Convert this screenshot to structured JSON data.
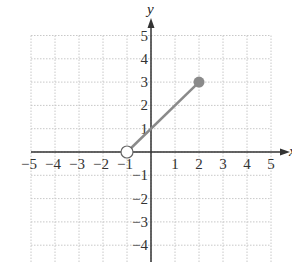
{
  "chart_data": {
    "type": "line",
    "title": "",
    "xlabel": "x",
    "ylabel": "y",
    "xlim": [
      -5,
      5
    ],
    "ylim": [
      -4.5,
      5.4
    ],
    "grid": true,
    "x_ticks": [
      "-5",
      "-4",
      "-3",
      "-2",
      "-1",
      "1",
      "2",
      "3",
      "4",
      "5"
    ],
    "y_ticks": [
      "5",
      "4",
      "3",
      "2",
      "1",
      "-1",
      "-2",
      "-3",
      "-4"
    ],
    "series": [
      {
        "name": "segment",
        "points": [
          {
            "x": -1,
            "y": 0
          },
          {
            "x": 2,
            "y": 3
          }
        ],
        "start_endpoint": "open",
        "end_endpoint": "closed",
        "color": "#8a8a8a"
      }
    ]
  },
  "colors": {
    "axis": "#333333",
    "grid": "#c8c8c8",
    "segment": "#8a8a8a"
  }
}
